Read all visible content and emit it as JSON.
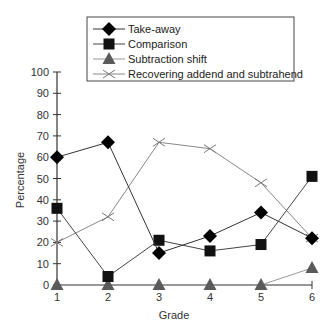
{
  "chart_data": {
    "type": "line",
    "title": "",
    "xlabel": "Grade",
    "ylabel": "Percentage",
    "x": [
      1,
      2,
      3,
      4,
      5,
      6
    ],
    "categories": [
      "1",
      "2",
      "3",
      "4",
      "5",
      "6"
    ],
    "ylim": [
      0,
      100
    ],
    "yticks": [
      0,
      10,
      20,
      30,
      40,
      50,
      60,
      70,
      80,
      90,
      100
    ],
    "grid": false,
    "legend_position": "top",
    "series": [
      {
        "name": "Take-away",
        "marker": "diamond",
        "color": "#000000",
        "values": [
          60,
          67,
          15,
          23,
          34,
          22
        ]
      },
      {
        "name": "Comparison",
        "marker": "square",
        "color": "#111111",
        "values": [
          36,
          4,
          21,
          16,
          19,
          51
        ]
      },
      {
        "name": "Subtraction shift",
        "marker": "triangle",
        "color": "#555555",
        "values": [
          0,
          0,
          0,
          0,
          0,
          8
        ]
      },
      {
        "name": "Recovering addend and subtrahend",
        "marker": "x",
        "color": "#777777",
        "values": [
          20,
          32,
          67,
          64,
          48,
          22
        ]
      }
    ]
  },
  "legend": {
    "items": [
      "Take-away",
      "Comparison",
      "Subtraction shift",
      "Recovering addend and subtrahend"
    ]
  },
  "axes": {
    "xlabel": "Grade",
    "ylabel": "Percentage",
    "yticks": [
      "0",
      "10",
      "20",
      "30",
      "40",
      "50",
      "60",
      "70",
      "80",
      "90",
      "100"
    ],
    "xticks": [
      "1",
      "2",
      "3",
      "4",
      "5",
      "6"
    ]
  }
}
